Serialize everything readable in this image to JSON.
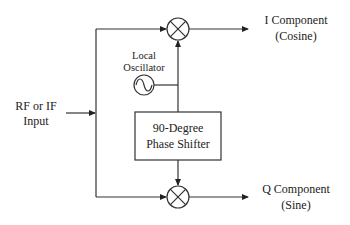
{
  "diagram": {
    "nodes": {
      "input": {
        "line1": "RF or IF",
        "line2": "Input"
      },
      "local_oscillator": {
        "line1": "Local",
        "line2": "Oscillator"
      },
      "phase_shifter": {
        "line1": "90-Degree",
        "line2": "Phase Shifter"
      },
      "mixer_top": {
        "symbol": "multiply"
      },
      "mixer_bottom": {
        "symbol": "multiply"
      },
      "output_i": {
        "line1": "I Component",
        "line2": "(Cosine)"
      },
      "output_q": {
        "line1": "Q Component",
        "line2": "(Sine)"
      }
    },
    "edges": [
      {
        "from": "input",
        "to": "mixer_top"
      },
      {
        "from": "input",
        "to": "mixer_bottom"
      },
      {
        "from": "local_oscillator",
        "to": "mixer_top"
      },
      {
        "from": "local_oscillator",
        "to": "phase_shifter"
      },
      {
        "from": "phase_shifter",
        "to": "mixer_bottom"
      },
      {
        "from": "mixer_top",
        "to": "output_i"
      },
      {
        "from": "mixer_bottom",
        "to": "output_q"
      }
    ],
    "colors": {
      "stroke": "#333333",
      "text": "#222222",
      "background": "#ffffff"
    }
  }
}
